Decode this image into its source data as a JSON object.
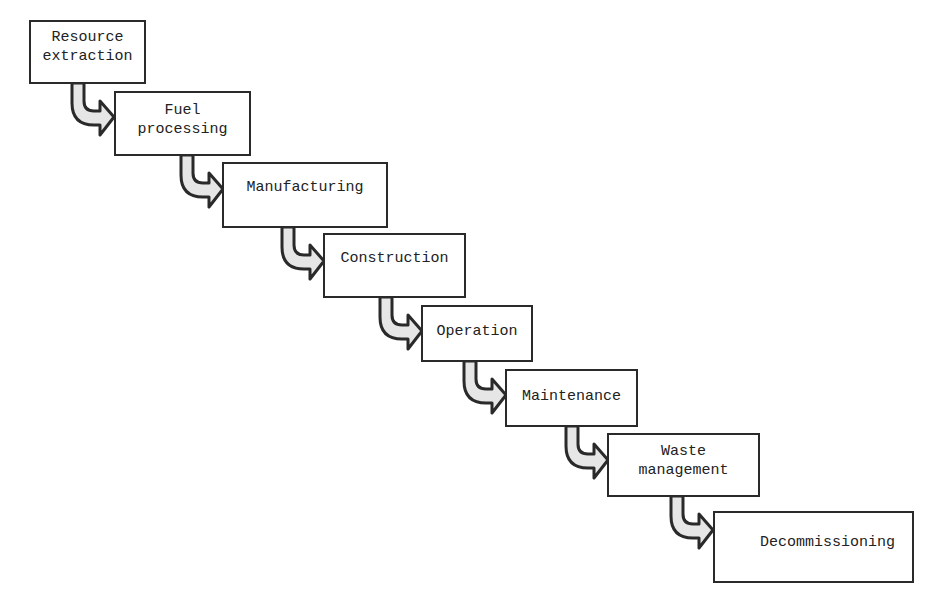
{
  "diagram": {
    "type": "flow-staircase",
    "colors": {
      "border": "#2a2a2a",
      "arrow_fill": "#e6e6e6",
      "text": "#222222",
      "background": "#ffffff"
    },
    "steps": [
      {
        "id": "resource-extraction",
        "line1": "Resource",
        "line2": "extraction"
      },
      {
        "id": "fuel-processing",
        "line1": "Fuel",
        "line2": "processing"
      },
      {
        "id": "manufacturing",
        "line1": "Manufacturing",
        "line2": ""
      },
      {
        "id": "construction",
        "line1": "Construction",
        "line2": ""
      },
      {
        "id": "operation",
        "line1": "Operation",
        "line2": ""
      },
      {
        "id": "maintenance",
        "line1": "Maintenance",
        "line2": ""
      },
      {
        "id": "waste-management",
        "line1": "Waste",
        "line2": "management"
      },
      {
        "id": "decommissioning",
        "line1": "Decommissioning",
        "line2": ""
      }
    ]
  }
}
